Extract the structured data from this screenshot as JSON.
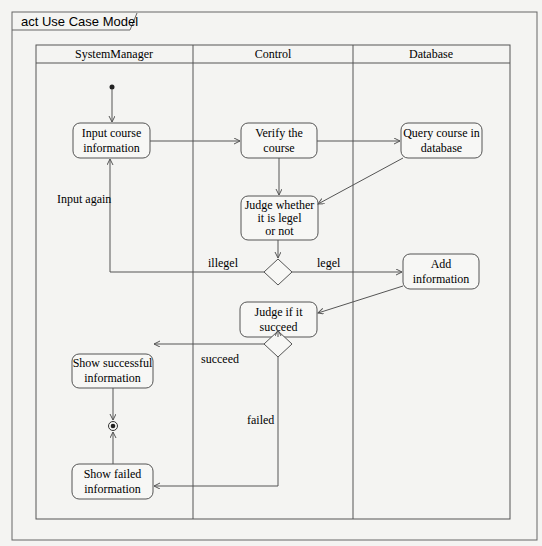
{
  "frame": {
    "title": "act Use Case Model"
  },
  "lanes": [
    {
      "name": "SystemManager"
    },
    {
      "name": "Control"
    },
    {
      "name": "Database"
    }
  ],
  "nodes": {
    "input_course": {
      "lines": [
        "Input course",
        "information"
      ]
    },
    "verify_course": {
      "lines": [
        "Verify the",
        "course"
      ]
    },
    "query_course": {
      "lines": [
        "Query course in",
        "database"
      ]
    },
    "judge_legel": {
      "lines": [
        "Judge whether",
        "it is legel",
        "or not"
      ]
    },
    "add_info": {
      "lines": [
        "Add",
        "information"
      ]
    },
    "judge_succeed": {
      "lines": [
        "Judge if it",
        "succeed"
      ]
    },
    "show_success": {
      "lines": [
        "Show successful",
        "information"
      ]
    },
    "show_failed": {
      "lines": [
        "Show failed",
        "information"
      ]
    }
  },
  "edge_labels": {
    "input_again": "Input again",
    "illegel": "illegel",
    "legel": "legel",
    "succeed": "succeed",
    "failed": "failed"
  },
  "colors": {
    "line": "#555555",
    "background": "#f4f4f2",
    "node_fill": "#f7f7f5"
  }
}
